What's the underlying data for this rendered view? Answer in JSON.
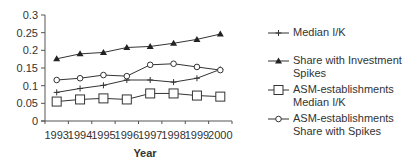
{
  "chart_data": {
    "type": "line",
    "title": "",
    "xlabel": "Year",
    "ylabel": "",
    "ylim": [
      0,
      0.3
    ],
    "yticks": [
      "0",
      "0.05",
      "0.1",
      "0.15",
      "0.2",
      "0.25",
      "0.3"
    ],
    "grid": false,
    "legend_position": "right",
    "categories": [
      "1993",
      "1994",
      "1995",
      "1996",
      "1997",
      "1998",
      "1999",
      "2000"
    ],
    "series": [
      {
        "name": "Median I/K",
        "legend_lines": [
          "Median I/K"
        ],
        "marker": "plus",
        "values": [
          0.081,
          0.092,
          0.101,
          0.116,
          0.116,
          0.11,
          0.121,
          0.146
        ]
      },
      {
        "name": "Share with Investment Spikes",
        "legend_lines": [
          "Share with Investment",
          "Spikes"
        ],
        "marker": "triangle",
        "values": [
          0.176,
          0.19,
          0.194,
          0.208,
          0.211,
          0.22,
          0.231,
          0.246
        ]
      },
      {
        "name": "ASM-establishments Median I/K",
        "legend_lines": [
          "ASM-establishments",
          "Median I/K"
        ],
        "marker": "square",
        "values": [
          0.055,
          0.061,
          0.064,
          0.061,
          0.078,
          0.078,
          0.072,
          0.069
        ]
      },
      {
        "name": "ASM-establishments Share with Spikes",
        "legend_lines": [
          "ASM-establishments",
          "Share with Spikes"
        ],
        "marker": "circle",
        "values": [
          0.116,
          0.121,
          0.13,
          0.127,
          0.159,
          0.162,
          0.153,
          0.144
        ]
      }
    ]
  },
  "colors": {
    "line": "#333333",
    "axis": "#555555",
    "text": "#333333"
  }
}
